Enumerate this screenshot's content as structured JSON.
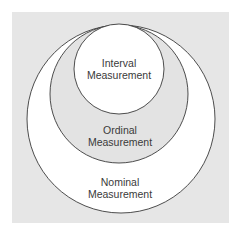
{
  "diagram": {
    "type": "nested-circles",
    "colors": {
      "panel": "#e6e6e6",
      "ring_fill_outer": "#ffffff",
      "ring_fill_middle": "#e3e3e3",
      "ring_fill_inner": "#ffffff",
      "stroke": "#3a3a3a",
      "text": "#3a3a3a"
    },
    "circles": [
      {
        "id": "nominal",
        "line1": "Nominal",
        "line2": "Measurement"
      },
      {
        "id": "ordinal",
        "line1": "Ordinal",
        "line2": "Measurement"
      },
      {
        "id": "interval",
        "line1": "Interval",
        "line2": "Measurement"
      }
    ]
  }
}
